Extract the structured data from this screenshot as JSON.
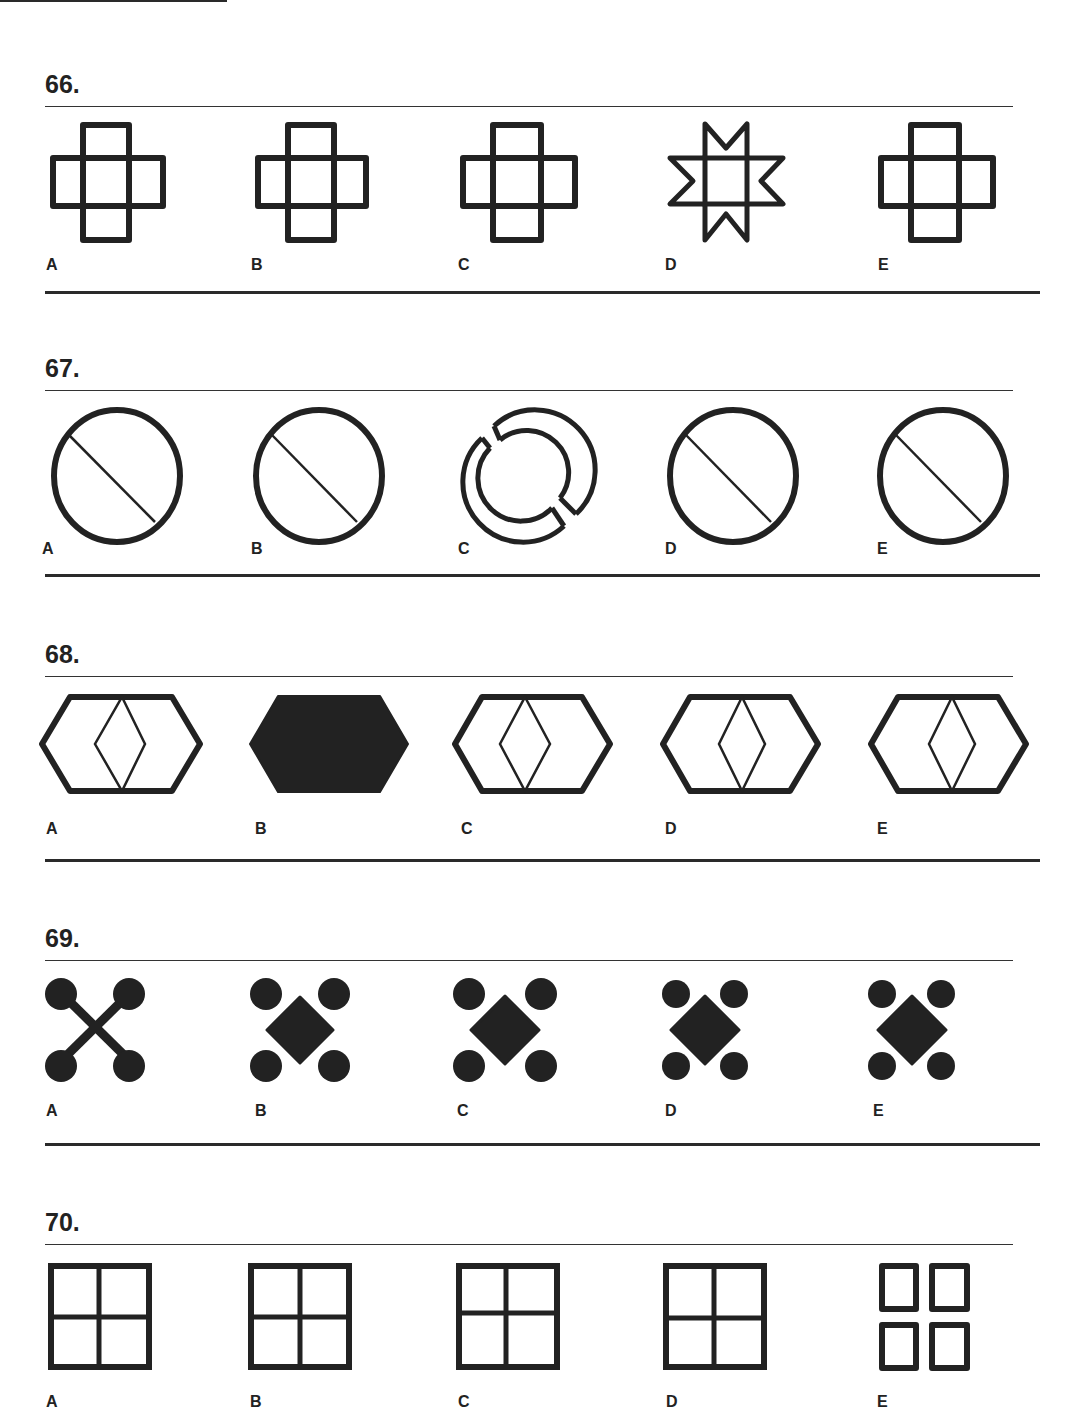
{
  "page": {
    "type": "odd-one-out figure puzzles",
    "option_letters": [
      "A",
      "B",
      "C",
      "D",
      "E"
    ],
    "ink_color": "#222222"
  },
  "questions": [
    {
      "number": "66.",
      "options": [
        {
          "label": "A",
          "figure": "outlined plus/cross of overlapping rectangles"
        },
        {
          "label": "B",
          "figure": "outlined plus/cross of overlapping rectangles"
        },
        {
          "label": "C",
          "figure": "outlined plus/cross of overlapping rectangles"
        },
        {
          "label": "D",
          "figure": "outlined eight-point star (square with triangle points)"
        },
        {
          "label": "E",
          "figure": "outlined plus/cross of overlapping rectangles"
        }
      ]
    },
    {
      "number": "67.",
      "options": [
        {
          "label": "A",
          "figure": "circle with diagonal line"
        },
        {
          "label": "B",
          "figure": "circle with diagonal line"
        },
        {
          "label": "C",
          "figure": "double broken ring"
        },
        {
          "label": "D",
          "figure": "circle with diagonal line"
        },
        {
          "label": "E",
          "figure": "circle with diagonal line"
        }
      ]
    },
    {
      "number": "68.",
      "options": [
        {
          "label": "A",
          "figure": "outlined hexagon with inner diamond"
        },
        {
          "label": "B",
          "figure": "solid filled hexagon"
        },
        {
          "label": "C",
          "figure": "outlined hexagon with inner diamond"
        },
        {
          "label": "D",
          "figure": "outlined hexagon with inner diamond"
        },
        {
          "label": "E",
          "figure": "outlined hexagon with inner diamond"
        }
      ]
    },
    {
      "number": "69.",
      "options": [
        {
          "label": "A",
          "figure": "four dots joined by an X"
        },
        {
          "label": "B",
          "figure": "four dots around solid diamond"
        },
        {
          "label": "C",
          "figure": "four dots around solid diamond"
        },
        {
          "label": "D",
          "figure": "four dots around solid diamond"
        },
        {
          "label": "E",
          "figure": "four dots around solid diamond"
        }
      ]
    },
    {
      "number": "70.",
      "options": [
        {
          "label": "A",
          "figure": "square divided into four panes"
        },
        {
          "label": "B",
          "figure": "square divided into four panes"
        },
        {
          "label": "C",
          "figure": "square divided into four panes"
        },
        {
          "label": "D",
          "figure": "square divided into four panes"
        },
        {
          "label": "E",
          "figure": "four separate small squares"
        }
      ]
    }
  ]
}
